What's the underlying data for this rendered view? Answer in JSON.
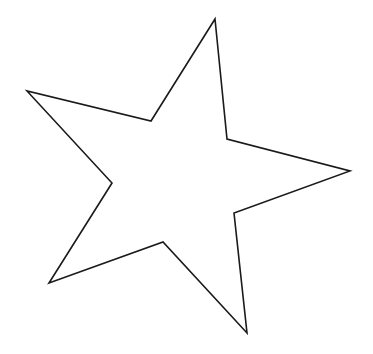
{
  "canvas": {
    "width": 373,
    "height": 354,
    "background": "#ffffff"
  },
  "shape": {
    "type": "star",
    "points_count": 5,
    "fill": "#ffffff",
    "stroke": "#1a1a1a",
    "stroke_width": 1.6,
    "vertices": [
      [
        215,
        19
      ],
      [
        227,
        139
      ],
      [
        350,
        171
      ],
      [
        234,
        213
      ],
      [
        247,
        333
      ],
      [
        163,
        242
      ],
      [
        49,
        283
      ],
      [
        112,
        183
      ],
      [
        27,
        91
      ],
      [
        151,
        121
      ]
    ]
  }
}
